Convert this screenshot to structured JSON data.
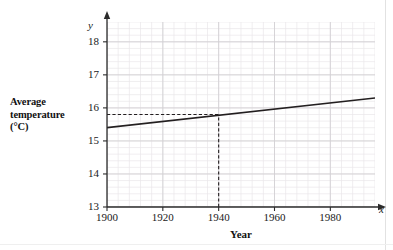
{
  "chart_data": {
    "type": "line",
    "title": "",
    "xlabel": "Year",
    "ylabel": "Average temperature (°C)",
    "x_axis_variable": "x",
    "y_axis_variable": "y",
    "xlim": [
      1900,
      1996
    ],
    "ylim": [
      13,
      18.6
    ],
    "xticks": [
      1900,
      1920,
      1940,
      1960,
      1980
    ],
    "yticks": [
      13,
      14,
      15,
      16,
      17,
      18
    ],
    "xtick_labels": [
      "1900",
      "1920",
      "1940",
      "1960",
      "1980"
    ],
    "ytick_labels": [
      "13",
      "14",
      "15",
      "16",
      "17",
      "18"
    ],
    "grid": true,
    "grid_minor_x_step": 4,
    "grid_minor_y_step": 0.2,
    "legend": "none",
    "series": [
      {
        "name": "Average temperature trend",
        "style": "solid",
        "color": "#231f20",
        "x": [
          1900,
          1996
        ],
        "values": [
          15.4,
          16.3
        ]
      }
    ],
    "annotations": [
      {
        "name": "reading-guide",
        "style": "dashed",
        "color": "#231f20",
        "horizontal_from_x": 1900,
        "horizontal_to_x": 1940,
        "horizontal_y": 15.8,
        "vertical_x": 1940,
        "vertical_from_y": 13,
        "vertical_to_y": 15.8,
        "read_x": 1940,
        "read_y": 15.8
      }
    ]
  },
  "labels": {
    "y_title_line1": "Average",
    "y_title_line2": "temperature",
    "y_title_line3": "(°C)",
    "x_title": "Year",
    "y_variable": "y",
    "x_variable": "x"
  }
}
